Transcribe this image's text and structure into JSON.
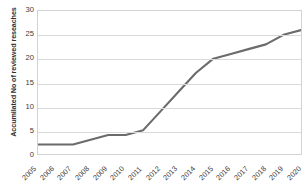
{
  "chart_data": {
    "type": "line",
    "title": "",
    "xlabel": "",
    "ylabel": "Accumilated No of reviewed reseaches",
    "categories": [
      "2005",
      "2006",
      "2007",
      "2008",
      "2009",
      "2010",
      "2011",
      "2012",
      "2013",
      "2014",
      "2015",
      "2016",
      "2017",
      "2018",
      "2019",
      "2020"
    ],
    "values": [
      2,
      2,
      2,
      3,
      4,
      4,
      5,
      9,
      13,
      17,
      20,
      21,
      22,
      23,
      25,
      26
    ],
    "series": [
      {
        "name": "Accumilated No of reviewed reseaches",
        "values": [
          2,
          2,
          2,
          3,
          4,
          4,
          5,
          9,
          13,
          17,
          20,
          21,
          22,
          23,
          25,
          26
        ]
      }
    ],
    "ylim": [
      0,
      30
    ],
    "yticks": [
      0,
      5,
      10,
      15,
      20,
      25,
      30
    ],
    "ytick_labels": [
      "0",
      "5",
      "10",
      "15",
      "20",
      "25",
      "30"
    ],
    "grid": true,
    "grid_axis": "y",
    "legend": false,
    "legend_position": "none",
    "line_color": "#6b6b6b",
    "grid_color": "#d9d9d9",
    "plot_border_color": "#d2d2d2",
    "background_color": "#ffffff",
    "text_color": "#3a3a3a"
  }
}
